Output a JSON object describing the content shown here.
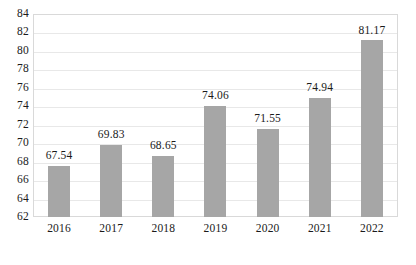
{
  "chart_data": {
    "type": "bar",
    "title": "",
    "subtitle": "",
    "xlabel": "",
    "ylabel": "",
    "categories": [
      "2016",
      "2017",
      "2018",
      "2019",
      "2020",
      "2021",
      "2022"
    ],
    "values": [
      67.54,
      69.83,
      68.65,
      74.06,
      71.55,
      74.94,
      81.17
    ],
    "data_labels": [
      "67.54",
      "69.83",
      "68.65",
      "74.06",
      "71.55",
      "74.94",
      "81.17"
    ],
    "ylim": [
      62,
      84
    ],
    "ytick_step": 2,
    "ytick_labels": [
      "84",
      "82",
      "80",
      "78",
      "76",
      "74",
      "72",
      "70",
      "68",
      "66",
      "64",
      "62"
    ],
    "grid": true,
    "grid_axis": "y",
    "legend": false,
    "legend_position": "none",
    "series": [
      {
        "name": "",
        "values": [
          67.54,
          69.83,
          68.65,
          74.06,
          71.55,
          74.94,
          81.17
        ],
        "color": "#a6a6a6"
      }
    ],
    "colors": {
      "bar": "#a6a6a6",
      "gridline": "#e8e8e8",
      "plot_border": "#d9d9d9",
      "text": "#1a1a1a",
      "background": "#ffffff"
    }
  }
}
